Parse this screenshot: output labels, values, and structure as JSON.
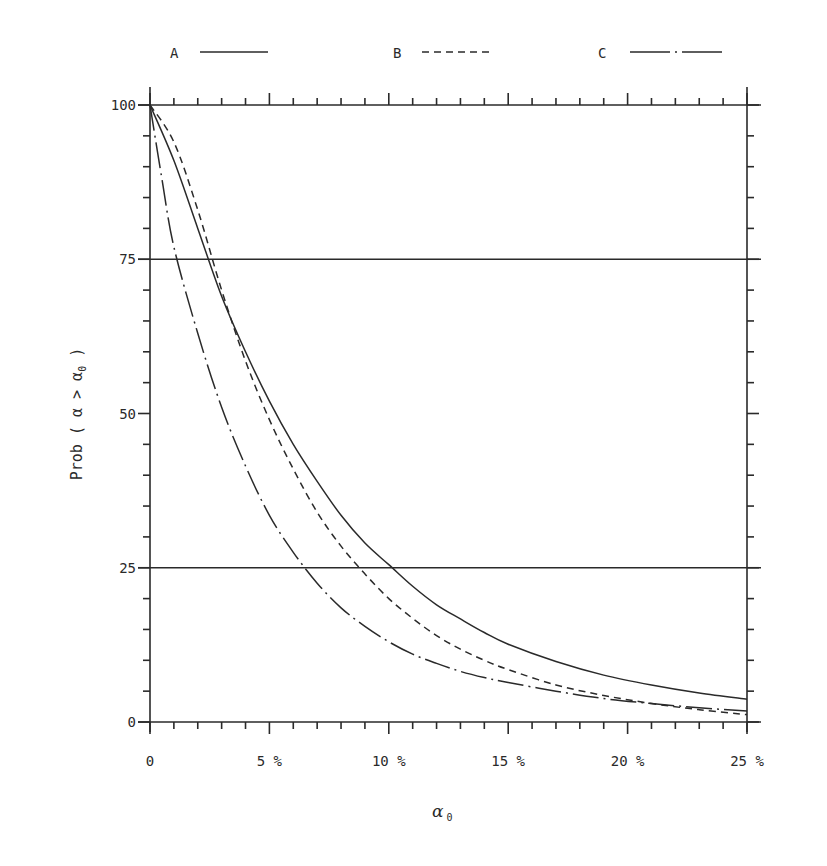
{
  "chart_data": {
    "type": "line",
    "title": "",
    "xlabel": "α₀",
    "ylabel": "Prob ( α > α₀ )",
    "xlim": [
      0,
      25
    ],
    "ylim": [
      0,
      100
    ],
    "x_unit": "%",
    "xticks": [
      0,
      5,
      10,
      15,
      20,
      25
    ],
    "xtick_labels": [
      "0",
      "5 %",
      "10 %",
      "15 %",
      "20 %",
      "25 %"
    ],
    "x_minor_step": 1,
    "yticks": [
      0,
      25,
      50,
      75,
      100
    ],
    "ytick_labels": [
      "0",
      "25",
      "50",
      "75",
      "100"
    ],
    "y_minor_step": 5,
    "grid": "horizontal reference lines at 25, 75 and 100",
    "reference_lines_y": [
      25,
      75
    ],
    "legend_position": "top",
    "series": [
      {
        "name": "A",
        "style": "solid",
        "x": [
          0,
          1,
          2,
          3,
          4,
          5,
          6,
          7,
          8,
          9,
          10,
          11,
          12,
          13,
          14,
          15,
          17,
          19,
          21,
          23,
          25
        ],
        "values": [
          100,
          91,
          80,
          69,
          60,
          52,
          45,
          39,
          33.5,
          29,
          25.5,
          22,
          19,
          16.7,
          14.5,
          12.6,
          9.8,
          7.6,
          6,
          4.7,
          3.7
        ]
      },
      {
        "name": "B",
        "style": "dashed",
        "x": [
          0,
          1,
          2,
          3,
          4,
          5,
          6,
          7,
          8,
          9,
          10,
          11,
          12,
          13,
          14,
          15,
          17,
          19,
          21,
          23,
          25
        ],
        "values": [
          100,
          94,
          83,
          70,
          58.5,
          49,
          41,
          34,
          28.5,
          24,
          20,
          16.8,
          14,
          11.8,
          10,
          8.5,
          6,
          4.3,
          3,
          2,
          1.2
        ]
      },
      {
        "name": "C",
        "style": "dash-dot",
        "x": [
          0,
          0.5,
          1,
          2,
          3,
          4,
          5,
          6,
          7,
          8,
          9,
          10,
          11,
          12,
          13,
          14,
          15,
          17,
          19,
          21,
          23,
          25
        ],
        "values": [
          100,
          88,
          77,
          63,
          51,
          41.5,
          33.5,
          27.5,
          22.5,
          18.5,
          15.5,
          13,
          11,
          9.5,
          8.2,
          7.2,
          6.4,
          5,
          3.8,
          3,
          2.3,
          1.8
        ]
      }
    ]
  },
  "legend": [
    {
      "label": "A",
      "style": "solid"
    },
    {
      "label": "B",
      "style": "dashed"
    },
    {
      "label": "C",
      "style": "dash-dot"
    }
  ],
  "axes": {
    "ylabel_main": "Prob ( α > α",
    "ylabel_sub": "0",
    "ylabel_close": " )",
    "xlabel_main": "α",
    "xlabel_sub": "0"
  },
  "colors": {
    "ink": "#2a2a2a",
    "background": "#ffffff"
  }
}
